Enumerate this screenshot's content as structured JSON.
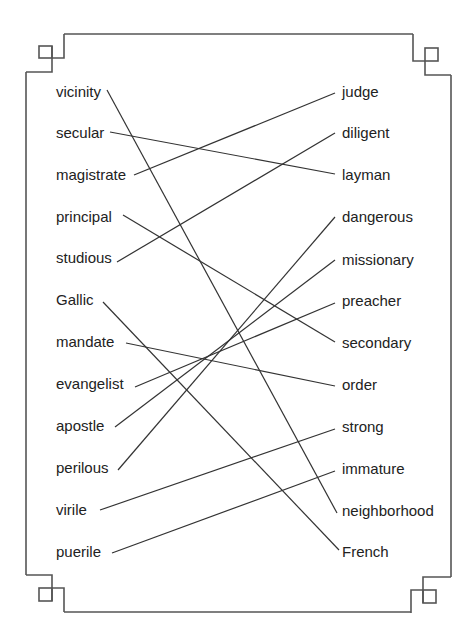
{
  "exercise": {
    "type": "word matching (synonyms)",
    "left_words": [
      "vicinity",
      "secular",
      "magistrate",
      "principal",
      "studious",
      "Gallic",
      "mandate",
      "evangelist",
      "apostle",
      "perilous",
      "virile",
      "puerile"
    ],
    "right_words": [
      "judge",
      "diligent",
      "layman",
      "dangerous",
      "missionary",
      "preacher",
      "secondary",
      "order",
      "strong",
      "immature",
      "neighborhood",
      "French"
    ],
    "matches": [
      {
        "left": "vicinity",
        "right": "neighborhood"
      },
      {
        "left": "secular",
        "right": "layman"
      },
      {
        "left": "magistrate",
        "right": "judge"
      },
      {
        "left": "principal",
        "right": "secondary"
      },
      {
        "left": "studious",
        "right": "diligent"
      },
      {
        "left": "Gallic",
        "right": "French"
      },
      {
        "left": "mandate",
        "right": "order"
      },
      {
        "left": "evangelist",
        "right": "preacher"
      },
      {
        "left": "apostle",
        "right": "missionary"
      },
      {
        "left": "perilous",
        "right": "dangerous"
      },
      {
        "left": "virile",
        "right": "strong"
      },
      {
        "left": "puerile",
        "right": "immature"
      }
    ]
  },
  "colors": {
    "text": "#222222",
    "line": "#333333",
    "frame": "#555555",
    "background": "#ffffff"
  }
}
